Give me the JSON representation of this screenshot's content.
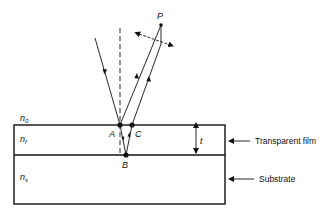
{
  "diagram": {
    "colors": {
      "ink": "#111111",
      "background": "#ffffff"
    },
    "labels": {
      "ambient_index": "n",
      "ambient_index_sub": "0",
      "film_index": "n",
      "film_index_sub": "f",
      "substrate_index": "n",
      "substrate_index_sub": "s",
      "point_p": "P",
      "point_a": "A",
      "point_b": "B",
      "point_c": "C",
      "thickness": "t"
    },
    "callouts": {
      "film": "Transparent film",
      "substrate": "Substrate"
    }
  }
}
